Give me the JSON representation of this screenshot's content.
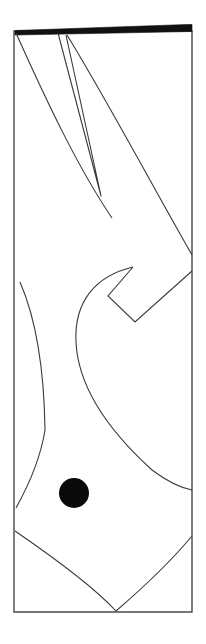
{
  "document": {
    "kind": "line-art-drawing",
    "background_color": "#ffffff",
    "stroke_color": "#3a3a3a",
    "fill_color": "#0a0a0a",
    "canvas_width": 206,
    "canvas_height": 644
  },
  "figure": {
    "title": "",
    "frame": {
      "name": "page-frame",
      "left": 14,
      "right": 192,
      "top": 31,
      "bottom": 612,
      "stroke_width": 1.4
    },
    "top_band": {
      "name": "black-header-band",
      "color": "#111111",
      "points": "15,31 186,25 192,31 15,34",
      "thickness": 6
    },
    "shapes": [
      {
        "name": "narrow-wedge",
        "type": "open-polyline",
        "points": "59,33 101,195 65,35"
      },
      {
        "name": "left-long-diagonal",
        "type": "curve",
        "points": "16,32 60,120 110,215"
      },
      {
        "name": "upper-right-diagonal",
        "type": "curve",
        "points": "68,35 140,160 192,256"
      },
      {
        "name": "arrow-chevron",
        "type": "closed-polygon",
        "points": "132,268 109,295 135,320 192,270"
      },
      {
        "name": "hook-curve",
        "type": "curve",
        "points": "132,268 82,288 72,330 120,420"
      },
      {
        "name": "leaf-outline-left",
        "type": "curve",
        "points": "20,283 44,340 45,432 14,500"
      },
      {
        "name": "lower-right-sweep",
        "type": "curve",
        "points": "110,340 150,430 192,485"
      },
      {
        "name": "bottom-left-arc",
        "type": "curve",
        "points": "15,533 80,575 116,612"
      },
      {
        "name": "bottom-right-arc",
        "type": "curve",
        "points": "116,612 160,580 192,537"
      }
    ],
    "circle": {
      "name": "filled-dot",
      "cx": 74,
      "cy": 493,
      "r": 15,
      "fill": "#0a0a0a"
    }
  }
}
